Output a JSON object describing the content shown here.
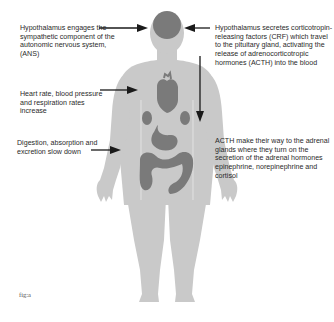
{
  "annotations": {
    "hypothalamus_ans": "Hypothalamus engages the sympathetic component of the autonomic nervous system, (ANS)",
    "hypothalamus_crf": "Hypothalamus secretes corticotropin-releasing factors (CRF) which travel to the pituitary gland, activating the release of adrenocorticotropic hormones (ACTH) into the blood",
    "heart_rate": "Heart rate, blood pressure and respiration rates increase",
    "acth_adrenal": "ACTH make their way to the adrenal glands where they turn on the secretion of the adrenal hormones epinephrine, norepinephrine and cortisol",
    "digestion": "Digestion, absorption and excretion slow down"
  },
  "figure_label": "fig:a",
  "colors": {
    "body": "#c9c9c9",
    "organs": "#7a7a7a",
    "arrow": "#1a1a1a",
    "text": "#2a2a2a"
  }
}
